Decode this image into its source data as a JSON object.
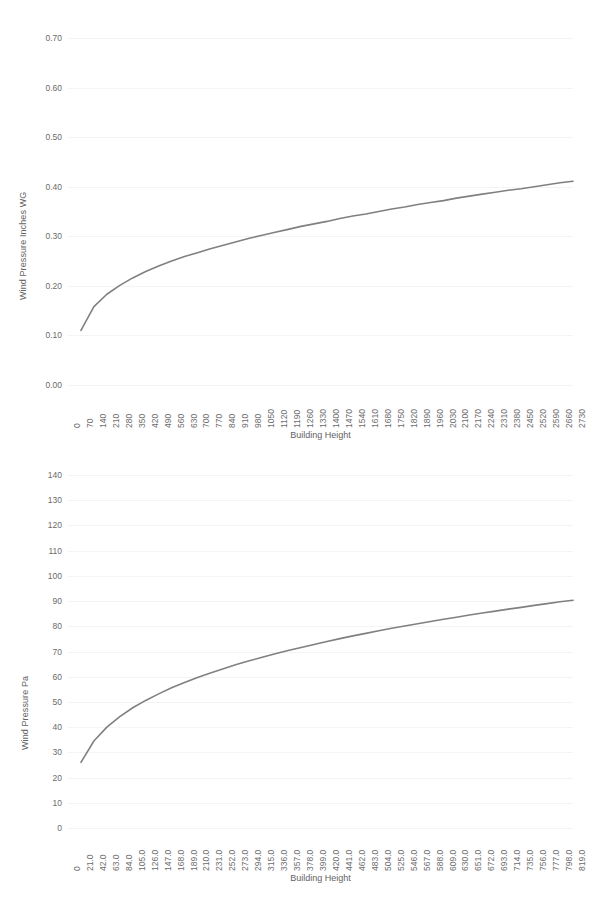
{
  "chart_data": [
    {
      "type": "line",
      "title": "",
      "xlabel": "Building Height",
      "ylabel": "Wind Pressure Inches WG",
      "xlim": [
        0,
        2730
      ],
      "ylim": [
        0.0,
        0.7
      ],
      "grid": true,
      "legend": "none",
      "line_color": "#808080",
      "categories": [
        "0",
        "70",
        "140",
        "210",
        "280",
        "350",
        "420",
        "490",
        "560",
        "630",
        "700",
        "770",
        "840",
        "910",
        "980",
        "1050",
        "1120",
        "1190",
        "1260",
        "1330",
        "1400",
        "1470",
        "1540",
        "1610",
        "1680",
        "1750",
        "1820",
        "1890",
        "1960",
        "2030",
        "2100",
        "2170",
        "2240",
        "2310",
        "2380",
        "2450",
        "2520",
        "2590",
        "2660",
        "2730"
      ],
      "ytick_labels": [
        "0.70",
        "0.60",
        "0.50",
        "0.40",
        "0.30",
        "0.20",
        "0.10",
        "0.00"
      ],
      "ytick_values": [
        0.7,
        0.6,
        0.5,
        0.4,
        0.3,
        0.2,
        0.1,
        0.0
      ],
      "x": [
        70,
        140,
        210,
        280,
        350,
        420,
        490,
        560,
        630,
        700,
        770,
        840,
        910,
        980,
        1050,
        1120,
        1190,
        1260,
        1330,
        1400,
        1470,
        1540,
        1610,
        1680,
        1750,
        1820,
        1890,
        1960,
        2030,
        2100,
        2170,
        2240,
        2310,
        2380,
        2450,
        2520,
        2590,
        2660,
        2730
      ],
      "values": [
        0.11,
        0.158,
        0.183,
        0.201,
        0.216,
        0.229,
        0.24,
        0.25,
        0.259,
        0.267,
        0.275,
        0.282,
        0.289,
        0.296,
        0.302,
        0.308,
        0.314,
        0.32,
        0.325,
        0.33,
        0.336,
        0.341,
        0.345,
        0.35,
        0.355,
        0.359,
        0.364,
        0.368,
        0.372,
        0.377,
        0.381,
        0.385,
        0.389,
        0.393,
        0.396,
        0.4,
        0.404,
        0.408,
        0.411
      ]
    },
    {
      "type": "line",
      "title": "",
      "xlabel": "Building Height",
      "ylabel": "Wind Pressure Pa",
      "xlim": [
        0,
        819
      ],
      "ylim": [
        0,
        140
      ],
      "grid": true,
      "legend": "none",
      "line_color": "#808080",
      "categories": [
        "0",
        "21.0",
        "42.0",
        "63.0",
        "84.0",
        "105.0",
        "126.0",
        "147.0",
        "168.0",
        "189.0",
        "210.0",
        "231.0",
        "252.0",
        "273.0",
        "294.0",
        "315.0",
        "336.0",
        "357.0",
        "378.0",
        "399.0",
        "420.0",
        "441.0",
        "462.0",
        "483.0",
        "504.0",
        "525.0",
        "546.0",
        "567.0",
        "588.0",
        "609.0",
        "630.0",
        "651.0",
        "672.0",
        "693.0",
        "714.0",
        "735.0",
        "756.0",
        "777.0",
        "798.0",
        "819.0"
      ],
      "ytick_labels": [
        "140",
        "130",
        "120",
        "110",
        "100",
        "90",
        "80",
        "70",
        "60",
        "50",
        "40",
        "30",
        "20",
        "10",
        "0"
      ],
      "ytick_values": [
        140,
        130,
        120,
        110,
        100,
        90,
        80,
        70,
        60,
        50,
        40,
        30,
        20,
        10,
        0
      ],
      "x": [
        21,
        42,
        63,
        84,
        105,
        126,
        147,
        168,
        189,
        210,
        231,
        252,
        273,
        294,
        315,
        336,
        357,
        378,
        399,
        420,
        441,
        462,
        483,
        504,
        525,
        546,
        567,
        588,
        609,
        630,
        651,
        672,
        693,
        714,
        735,
        756,
        777,
        798,
        819
      ],
      "values": [
        26.0,
        34.5,
        40.0,
        44.2,
        47.7,
        50.6,
        53.2,
        55.6,
        57.7,
        59.7,
        61.5,
        63.2,
        64.8,
        66.3,
        67.7,
        69.1,
        70.4,
        71.6,
        72.8,
        74.0,
        75.1,
        76.2,
        77.2,
        78.2,
        79.2,
        80.1,
        81.0,
        81.9,
        82.8,
        83.6,
        84.5,
        85.3,
        86.0,
        86.8,
        87.5,
        88.3,
        89.0,
        89.7,
        90.3
      ]
    }
  ]
}
